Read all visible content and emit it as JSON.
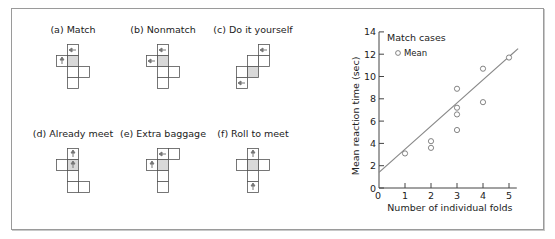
{
  "figure": {
    "panels": [
      {
        "id": "a",
        "label": "(a) Match",
        "cells": [
          [
            1,
            0
          ],
          [
            0,
            1
          ],
          [
            1,
            1
          ],
          [
            2,
            2
          ],
          [
            1,
            2
          ],
          [
            1,
            3
          ]
        ],
        "shaded": [
          1,
          1
        ],
        "arrows": [
          {
            "cell": [
              1,
              0
            ],
            "dir": "left"
          },
          {
            "cell": [
              0,
              1
            ],
            "dir": "vertical"
          }
        ]
      },
      {
        "id": "b",
        "label": "(b) Nonmatch",
        "cells": [
          [
            1,
            0
          ],
          [
            0,
            1
          ],
          [
            1,
            1
          ],
          [
            1,
            2
          ],
          [
            2,
            2
          ],
          [
            1,
            3
          ]
        ],
        "shaded": [
          1,
          1
        ],
        "arrows": [
          {
            "cell": [
              1,
              0
            ],
            "dir": "left"
          },
          {
            "cell": [
              0,
              1
            ],
            "dir": "left"
          }
        ]
      },
      {
        "id": "c",
        "label": "(c) Do it yourself",
        "cells": [
          [
            2,
            0
          ],
          [
            1,
            1
          ],
          [
            2,
            1
          ],
          [
            0,
            2
          ],
          [
            1,
            2
          ],
          [
            0,
            3
          ]
        ],
        "shaded": [
          1,
          2
        ],
        "arrows": [
          {
            "cell": [
              2,
              0
            ],
            "dir": "left"
          },
          {
            "cell": [
              0,
              3
            ],
            "dir": "left"
          }
        ]
      },
      {
        "id": "d",
        "label": "(d) Already meet",
        "cells": [
          [
            1,
            0
          ],
          [
            0,
            1
          ],
          [
            1,
            1
          ],
          [
            1,
            2
          ],
          [
            1,
            3
          ],
          [
            2,
            3
          ]
        ],
        "shaded": [
          1,
          1
        ],
        "arrows": [
          {
            "cell": [
              1,
              0
            ],
            "dir": "vertical"
          },
          {
            "cell": [
              1,
              1
            ],
            "dir": "vertical"
          }
        ]
      },
      {
        "id": "e",
        "label": "(e) Extra baggage",
        "cells": [
          [
            1,
            0
          ],
          [
            2,
            0
          ],
          [
            0,
            1
          ],
          [
            1,
            1
          ],
          [
            1,
            2
          ],
          [
            1,
            3
          ]
        ],
        "shaded": [
          1,
          1
        ],
        "arrows": [
          {
            "cell": [
              1,
              0
            ],
            "dir": "left"
          },
          {
            "cell": [
              0,
              1
            ],
            "dir": "vertical"
          }
        ]
      },
      {
        "id": "f",
        "label": "(f) Roll to meet",
        "cells": [
          [
            1,
            0
          ],
          [
            0,
            1
          ],
          [
            1,
            1
          ],
          [
            2,
            1
          ],
          [
            1,
            2
          ],
          [
            1,
            3
          ]
        ],
        "shaded": [
          1,
          1
        ],
        "arrows": [
          {
            "cell": [
              1,
              0
            ],
            "dir": "vertical"
          },
          {
            "cell": [
              1,
              3
            ],
            "dir": "vertical"
          }
        ]
      }
    ]
  },
  "chart_data": {
    "type": "scatter",
    "title": "",
    "legend_title": "Match cases",
    "legend_entries": [
      "Mean"
    ],
    "legend_position": "upper-left",
    "xlabel": "Number of individual folds",
    "ylabel": "Mean reaction time (sec)",
    "xlim": [
      0,
      5.3
    ],
    "ylim": [
      0,
      14
    ],
    "xticks": [
      0,
      1,
      2,
      3,
      4,
      5
    ],
    "yticks": [
      0,
      2,
      4,
      6,
      8,
      10,
      12,
      14
    ],
    "grid": false,
    "series": [
      {
        "name": "Mean",
        "marker": "open-circle",
        "points": [
          [
            1,
            3.1
          ],
          [
            2,
            4.2
          ],
          [
            2,
            3.6
          ],
          [
            3,
            8.9
          ],
          [
            3,
            7.2
          ],
          [
            3,
            6.6
          ],
          [
            3,
            5.2
          ],
          [
            4,
            10.7
          ],
          [
            4,
            7.7
          ],
          [
            5,
            11.7
          ]
        ]
      }
    ],
    "fit_line": {
      "x": [
        0,
        5.35
      ],
      "y": [
        1.4,
        12.5
      ]
    }
  },
  "colors": {
    "frame": "#9a9a9a",
    "shade": "#d9d9d9",
    "line": "#888888",
    "cell_border": "#555555",
    "arrow": "#777777"
  }
}
